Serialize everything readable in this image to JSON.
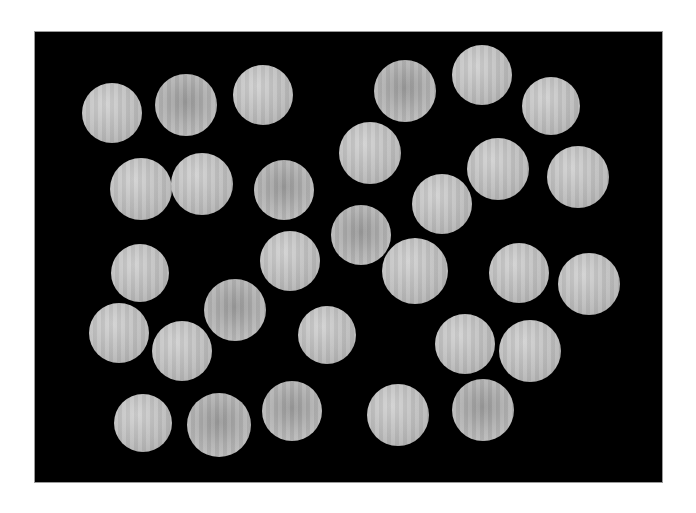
{
  "image": {
    "description": "Photograph of 30 round pale-gray discs arranged on a black background",
    "background_color": "#000000",
    "disc_color": "#bdbdbd",
    "frame": {
      "x": 34,
      "y": 31,
      "width": 629,
      "height": 452
    },
    "disc_count": 30,
    "discs": [
      {
        "cx": 111,
        "cy": 112,
        "r": 30,
        "tone": "light"
      },
      {
        "cx": 185,
        "cy": 104,
        "r": 31,
        "tone": "dark"
      },
      {
        "cx": 262,
        "cy": 94,
        "r": 30,
        "tone": "light"
      },
      {
        "cx": 404,
        "cy": 90,
        "r": 31,
        "tone": "dark"
      },
      {
        "cx": 481,
        "cy": 74,
        "r": 30,
        "tone": "light"
      },
      {
        "cx": 550,
        "cy": 105,
        "r": 29,
        "tone": "light"
      },
      {
        "cx": 369,
        "cy": 152,
        "r": 31,
        "tone": "light"
      },
      {
        "cx": 140,
        "cy": 188,
        "r": 31,
        "tone": "light"
      },
      {
        "cx": 201,
        "cy": 183,
        "r": 31,
        "tone": "light"
      },
      {
        "cx": 283,
        "cy": 189,
        "r": 30,
        "tone": "dark"
      },
      {
        "cx": 497,
        "cy": 168,
        "r": 31,
        "tone": "light"
      },
      {
        "cx": 577,
        "cy": 176,
        "r": 31,
        "tone": "light"
      },
      {
        "cx": 441,
        "cy": 203,
        "r": 30,
        "tone": "light"
      },
      {
        "cx": 360,
        "cy": 234,
        "r": 30,
        "tone": "dark"
      },
      {
        "cx": 289,
        "cy": 260,
        "r": 30,
        "tone": "light"
      },
      {
        "cx": 139,
        "cy": 272,
        "r": 29,
        "tone": "light"
      },
      {
        "cx": 414,
        "cy": 270,
        "r": 33,
        "tone": "light"
      },
      {
        "cx": 518,
        "cy": 272,
        "r": 30,
        "tone": "light"
      },
      {
        "cx": 588,
        "cy": 283,
        "r": 31,
        "tone": "light"
      },
      {
        "cx": 234,
        "cy": 309,
        "r": 31,
        "tone": "dark"
      },
      {
        "cx": 118,
        "cy": 332,
        "r": 30,
        "tone": "light"
      },
      {
        "cx": 181,
        "cy": 350,
        "r": 30,
        "tone": "light"
      },
      {
        "cx": 326,
        "cy": 334,
        "r": 29,
        "tone": "light"
      },
      {
        "cx": 464,
        "cy": 343,
        "r": 30,
        "tone": "light"
      },
      {
        "cx": 529,
        "cy": 350,
        "r": 31,
        "tone": "light"
      },
      {
        "cx": 142,
        "cy": 422,
        "r": 29,
        "tone": "light"
      },
      {
        "cx": 218,
        "cy": 424,
        "r": 32,
        "tone": "dark"
      },
      {
        "cx": 291,
        "cy": 410,
        "r": 30,
        "tone": "dark"
      },
      {
        "cx": 397,
        "cy": 414,
        "r": 31,
        "tone": "light"
      },
      {
        "cx": 482,
        "cy": 409,
        "r": 31,
        "tone": "dark"
      }
    ]
  }
}
